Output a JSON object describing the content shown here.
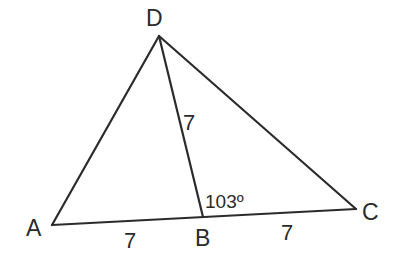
{
  "diagram": {
    "type": "triangle-geometry",
    "vertices": {
      "A": {
        "label": "A",
        "x": 52,
        "y": 225
      },
      "B": {
        "label": "B",
        "x": 203,
        "y": 217
      },
      "C": {
        "label": "C",
        "x": 356,
        "y": 209
      },
      "D": {
        "label": "D",
        "x": 159,
        "y": 36
      }
    },
    "segments": [
      {
        "name": "AD",
        "from": "A",
        "to": "D"
      },
      {
        "name": "DC",
        "from": "D",
        "to": "C"
      },
      {
        "name": "AC",
        "from": "A",
        "to": "C"
      },
      {
        "name": "DB",
        "from": "D",
        "to": "B"
      }
    ],
    "lengths": {
      "AB": "7",
      "BC": "7",
      "DB": "7"
    },
    "angle": {
      "DBC": "103º"
    },
    "colors": {
      "stroke": "#2b2b2b",
      "background": "#ffffff"
    }
  }
}
